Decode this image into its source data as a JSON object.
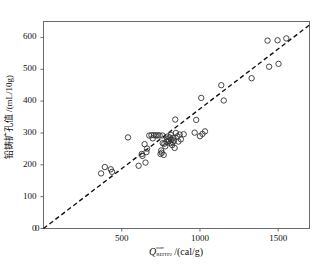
{
  "chart_data": {
    "type": "scatter",
    "title": "",
    "xlabel": "Q_REITP2^corr /(cal/g)",
    "ylabel": "铅铸扩孔值 /(mL/10g)",
    "xlabel_parts": {
      "symbol": "Q",
      "superscript": "corr",
      "subscript": "REITP2",
      "unit": "/(cal/g)"
    },
    "ylabel_text": "铅铸扩孔值 /(mL/10g)",
    "xlim": [
      0,
      1700
    ],
    "ylim": [
      0,
      650
    ],
    "xticks": [
      0,
      500,
      1000,
      1500
    ],
    "xtick_labels": [
      "0",
      "500",
      "1000",
      "1500"
    ],
    "yticks": [
      0,
      100,
      200,
      300,
      400,
      500,
      600
    ],
    "ytick_labels": [
      "0",
      "100",
      "200",
      "300",
      "400",
      "500",
      "600"
    ],
    "grid": false,
    "legend": null,
    "marker": "open-circle",
    "marker_color": "#333333",
    "line_color": "#111111",
    "line_style": "dashed",
    "trendline": {
      "type": "line",
      "style": "dashed",
      "through_origin": true,
      "slope": 0.376,
      "intercept": 0,
      "x_start": 0,
      "y_start": 0,
      "x_end": 1700,
      "y_end": 639
    },
    "points": [
      [
        368,
        173
      ],
      [
        392,
        193
      ],
      [
        430,
        186
      ],
      [
        438,
        178
      ],
      [
        540,
        286
      ],
      [
        608,
        197
      ],
      [
        628,
        234
      ],
      [
        632,
        228
      ],
      [
        652,
        207
      ],
      [
        646,
        265
      ],
      [
        658,
        240
      ],
      [
        662,
        251
      ],
      [
        676,
        292
      ],
      [
        690,
        293
      ],
      [
        698,
        283
      ],
      [
        706,
        293
      ],
      [
        718,
        292
      ],
      [
        730,
        293
      ],
      [
        742,
        292
      ],
      [
        748,
        234
      ],
      [
        752,
        245
      ],
      [
        756,
        238
      ],
      [
        760,
        292
      ],
      [
        762,
        268
      ],
      [
        768,
        231
      ],
      [
        772,
        266
      ],
      [
        778,
        258
      ],
      [
        786,
        272
      ],
      [
        790,
        280
      ],
      [
        794,
        289
      ],
      [
        798,
        276
      ],
      [
        802,
        274
      ],
      [
        806,
        286
      ],
      [
        810,
        268
      ],
      [
        814,
        294
      ],
      [
        818,
        279
      ],
      [
        822,
        262
      ],
      [
        826,
        271
      ],
      [
        830,
        285
      ],
      [
        834,
        276
      ],
      [
        838,
        253
      ],
      [
        842,
        342
      ],
      [
        846,
        300
      ],
      [
        856,
        289
      ],
      [
        862,
        273
      ],
      [
        870,
        295
      ],
      [
        878,
        280
      ],
      [
        896,
        296
      ],
      [
        966,
        301
      ],
      [
        976,
        341
      ],
      [
        1000,
        290
      ],
      [
        1008,
        410
      ],
      [
        1016,
        297
      ],
      [
        1032,
        305
      ],
      [
        1136,
        450
      ],
      [
        1152,
        402
      ],
      [
        1330,
        472
      ],
      [
        1432,
        590
      ],
      [
        1442,
        508
      ],
      [
        1496,
        591
      ],
      [
        1502,
        517
      ],
      [
        1552,
        597
      ]
    ]
  }
}
